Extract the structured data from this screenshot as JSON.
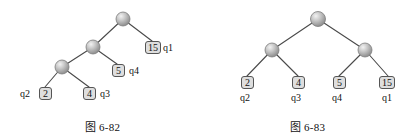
{
  "figure": {
    "type": "binary-tree-diagram",
    "colors": {
      "node_fill_light": "#e8e8e8",
      "node_fill_mid": "#b5b5b5",
      "node_fill_dark": "#8a8a8a",
      "node_stroke": "#7d7d7d",
      "edge": "#4a4a4a",
      "leaf_box_fill": "#dedede",
      "leaf_box_stroke": "#555555",
      "text": "#111111",
      "background": "#ffffff"
    }
  },
  "left_tree": {
    "caption": "图 6-82",
    "internal_nodes": [
      {
        "id": "root",
        "cx": 123,
        "cy": 19
      },
      {
        "id": "mid",
        "cx": 93,
        "cy": 47
      },
      {
        "id": "low",
        "cx": 62,
        "cy": 67
      }
    ],
    "edges": [
      {
        "from": "root",
        "to": "mid",
        "x1": 123,
        "y1": 19,
        "x2": 93,
        "y2": 47
      },
      {
        "from": "root",
        "to": "leaf15",
        "x1": 123,
        "y1": 19,
        "x2": 152,
        "y2": 41
      },
      {
        "from": "mid",
        "to": "low",
        "x1": 93,
        "y1": 47,
        "x2": 62,
        "y2": 67
      },
      {
        "from": "mid",
        "to": "leaf5",
        "x1": 93,
        "y1": 47,
        "x2": 117,
        "y2": 64
      },
      {
        "from": "low",
        "to": "leaf2",
        "x1": 62,
        "y1": 67,
        "x2": 45,
        "y2": 87
      },
      {
        "from": "low",
        "to": "leaf4",
        "x1": 62,
        "y1": 67,
        "x2": 89,
        "y2": 87
      }
    ],
    "leaves": [
      {
        "id": "leaf15",
        "value": "15",
        "q": "q1",
        "box_x": 145,
        "box_y": 41,
        "q_side": "right"
      },
      {
        "id": "leaf5",
        "value": "5",
        "q": "q4",
        "box_x": 112,
        "box_y": 64,
        "q_side": "right"
      },
      {
        "id": "leaf2",
        "value": "2",
        "q": "q2",
        "box_x": 39,
        "box_y": 87,
        "q_side": "left"
      },
      {
        "id": "leaf4",
        "value": "4",
        "q": "q3",
        "box_x": 83,
        "box_y": 87,
        "q_side": "right"
      }
    ]
  },
  "right_tree": {
    "caption": "图 6-83",
    "internal_nodes": [
      {
        "id": "root",
        "cx": 113,
        "cy": 19
      },
      {
        "id": "left",
        "cx": 67,
        "cy": 50
      },
      {
        "id": "right",
        "cx": 160,
        "cy": 50
      }
    ],
    "edges": [
      {
        "from": "root",
        "to": "left",
        "x1": 113,
        "y1": 19,
        "x2": 67,
        "y2": 50
      },
      {
        "from": "root",
        "to": "right",
        "x1": 113,
        "y1": 19,
        "x2": 160,
        "y2": 50
      },
      {
        "from": "left",
        "to": "leaf2",
        "x1": 67,
        "y1": 50,
        "x2": 42,
        "y2": 76
      },
      {
        "from": "left",
        "to": "leaf4",
        "x1": 67,
        "y1": 50,
        "x2": 93,
        "y2": 76
      },
      {
        "from": "right",
        "to": "leaf5",
        "x1": 160,
        "y1": 50,
        "x2": 134,
        "y2": 76
      },
      {
        "from": "right",
        "to": "leaf15",
        "x1": 160,
        "y1": 50,
        "x2": 183,
        "y2": 76
      }
    ],
    "leaves": [
      {
        "id": "leaf2",
        "value": "2",
        "q": "q2",
        "box_x": 36,
        "box_y": 76,
        "label_x": 36,
        "label_y": 92
      },
      {
        "id": "leaf4",
        "value": "4",
        "q": "q3",
        "box_x": 87,
        "box_y": 76,
        "label_x": 87,
        "label_y": 92
      },
      {
        "id": "leaf5",
        "value": "5",
        "q": "q4",
        "box_x": 128,
        "box_y": 76,
        "label_x": 128,
        "label_y": 92
      },
      {
        "id": "leaf15",
        "value": "15",
        "q": "q1",
        "box_x": 174,
        "box_y": 76,
        "label_x": 176,
        "label_y": 92
      }
    ]
  }
}
